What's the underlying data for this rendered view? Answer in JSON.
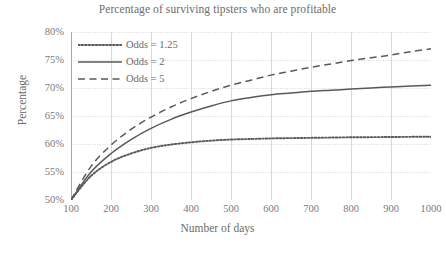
{
  "chart_data": {
    "type": "line",
    "title": "Percentage of surviving tipsters who are profitable",
    "xlabel": "Number of days",
    "ylabel": "Percentage",
    "xlim": [
      100,
      1000
    ],
    "ylim": [
      50,
      80
    ],
    "grid": true,
    "legend_position": "top-left inside plot",
    "x_tick_labels": [
      "100",
      "200",
      "300",
      "400",
      "500",
      "600",
      "700",
      "800",
      "900",
      "1000"
    ],
    "y_tick_labels": [
      "80%",
      "75%",
      "70%",
      "65%",
      "60%",
      "55%",
      "50%"
    ],
    "x": [
      100,
      150,
      200,
      250,
      300,
      350,
      400,
      450,
      500,
      550,
      600,
      650,
      700,
      750,
      800,
      850,
      900,
      950,
      1000
    ],
    "series": [
      {
        "name": "Odds = 1.25",
        "style": "dotted",
        "color": "#595959",
        "values": [
          50.0,
          54.3,
          56.8,
          58.3,
          59.3,
          59.9,
          60.3,
          60.6,
          60.8,
          60.9,
          61.0,
          61.05,
          61.1,
          61.15,
          61.2,
          61.22,
          61.25,
          61.28,
          61.3
        ]
      },
      {
        "name": "Odds = 2",
        "style": "solid",
        "color": "#595959",
        "values": [
          50.0,
          55.0,
          58.3,
          60.8,
          62.8,
          64.4,
          65.7,
          66.8,
          67.7,
          68.3,
          68.8,
          69.1,
          69.4,
          69.6,
          69.8,
          70.0,
          70.2,
          70.35,
          70.5
        ]
      },
      {
        "name": "Odds = 5",
        "style": "dashed",
        "color": "#595959",
        "values": [
          50.0,
          56.0,
          59.8,
          62.6,
          64.8,
          66.6,
          68.1,
          69.4,
          70.5,
          71.4,
          72.3,
          73.0,
          73.7,
          74.3,
          74.9,
          75.4,
          75.9,
          76.5,
          77.0
        ]
      }
    ]
  },
  "axis_colors": {
    "axis_line": "#a6a6a6",
    "grid_line": "#d9d9d9",
    "text": "#6b6b6b"
  }
}
